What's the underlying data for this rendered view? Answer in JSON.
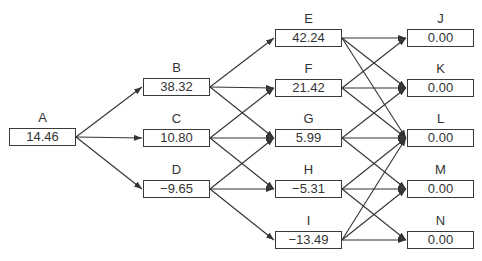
{
  "diagram": {
    "type": "layered-network",
    "nodes": [
      {
        "id": "A",
        "label": "A",
        "value": "14.46",
        "x": 9,
        "y": 128
      },
      {
        "id": "B",
        "label": "B",
        "value": "38.32",
        "x": 143,
        "y": 78
      },
      {
        "id": "C",
        "label": "C",
        "value": "10.80",
        "x": 143,
        "y": 129
      },
      {
        "id": "D",
        "label": "D",
        "value": "−9.65",
        "x": 143,
        "y": 180
      },
      {
        "id": "E",
        "label": "E",
        "value": "42.24",
        "x": 275,
        "y": 29
      },
      {
        "id": "F",
        "label": "F",
        "value": "21.42",
        "x": 275,
        "y": 79
      },
      {
        "id": "G",
        "label": "G",
        "value": "5.99",
        "x": 275,
        "y": 129
      },
      {
        "id": "H",
        "label": "H",
        "value": "−5.31",
        "x": 275,
        "y": 180
      },
      {
        "id": "I",
        "label": "I",
        "value": "−13.49",
        "x": 275,
        "y": 231
      },
      {
        "id": "J",
        "label": "J",
        "value": "0.00",
        "x": 407,
        "y": 29
      },
      {
        "id": "K",
        "label": "K",
        "value": "0.00",
        "x": 407,
        "y": 79
      },
      {
        "id": "L",
        "label": "L",
        "value": "0.00",
        "x": 407,
        "y": 129
      },
      {
        "id": "M",
        "label": "M",
        "value": "0.00",
        "x": 407,
        "y": 180
      },
      {
        "id": "N",
        "label": "N",
        "value": "0.00",
        "x": 407,
        "y": 231
      }
    ],
    "edges": [
      [
        "A",
        "B"
      ],
      [
        "A",
        "C"
      ],
      [
        "A",
        "D"
      ],
      [
        "B",
        "E"
      ],
      [
        "B",
        "F"
      ],
      [
        "B",
        "G"
      ],
      [
        "C",
        "F"
      ],
      [
        "C",
        "G"
      ],
      [
        "C",
        "H"
      ],
      [
        "D",
        "G"
      ],
      [
        "D",
        "H"
      ],
      [
        "D",
        "I"
      ],
      [
        "E",
        "J"
      ],
      [
        "E",
        "K"
      ],
      [
        "E",
        "L"
      ],
      [
        "F",
        "J"
      ],
      [
        "F",
        "K"
      ],
      [
        "F",
        "L"
      ],
      [
        "G",
        "K"
      ],
      [
        "G",
        "L"
      ],
      [
        "G",
        "M"
      ],
      [
        "H",
        "L"
      ],
      [
        "H",
        "M"
      ],
      [
        "H",
        "N"
      ],
      [
        "I",
        "L"
      ],
      [
        "I",
        "M"
      ],
      [
        "I",
        "N"
      ]
    ],
    "colors": {
      "line": "#333333",
      "box_border": "#3a3a3a",
      "text": "#333333"
    }
  }
}
